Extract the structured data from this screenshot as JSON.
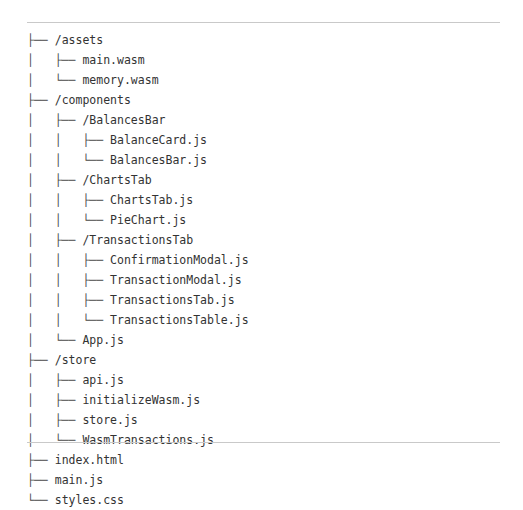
{
  "page": {
    "background_color": "#ffffff",
    "text_color": "#333333",
    "rule_color": "#c9c9c9",
    "clipped_header_fragment": "           "
  },
  "tree": {
    "rows": [
      {
        "prefix": "├── ",
        "label": "/assets"
      },
      {
        "prefix": "│   ├── ",
        "label": "main.wasm"
      },
      {
        "prefix": "│   └── ",
        "label": "memory.wasm"
      },
      {
        "prefix": "├── ",
        "label": "/components"
      },
      {
        "prefix": "│   ├── ",
        "label": "/BalancesBar"
      },
      {
        "prefix": "│   │   ├── ",
        "label": "BalanceCard.js"
      },
      {
        "prefix": "│   │   └── ",
        "label": "BalancesBar.js"
      },
      {
        "prefix": "│   ├── ",
        "label": "/ChartsTab"
      },
      {
        "prefix": "│   │   ├── ",
        "label": "ChartsTab.js"
      },
      {
        "prefix": "│   │   └── ",
        "label": "PieChart.js"
      },
      {
        "prefix": "│   ├── ",
        "label": "/TransactionsTab"
      },
      {
        "prefix": "│   │   ├── ",
        "label": "ConfirmationModal.js"
      },
      {
        "prefix": "│   │   ├── ",
        "label": "TransactionModal.js"
      },
      {
        "prefix": "│   │   ├── ",
        "label": "TransactionsTab.js"
      },
      {
        "prefix": "│   │   └── ",
        "label": "TransactionsTable.js"
      },
      {
        "prefix": "│   └── ",
        "label": "App.js"
      },
      {
        "prefix": "├── ",
        "label": "/store"
      },
      {
        "prefix": "│   ├── ",
        "label": "api.js"
      },
      {
        "prefix": "│   ├── ",
        "label": "initializeWasm.js"
      },
      {
        "prefix": "│   ├── ",
        "label": "store.js"
      },
      {
        "prefix": "│   └── ",
        "label": "WasmTransactions.js"
      },
      {
        "prefix": "├── ",
        "label": "index.html"
      },
      {
        "prefix": "├── ",
        "label": "main.js"
      },
      {
        "prefix": "└── ",
        "label": "styles.css"
      }
    ]
  }
}
